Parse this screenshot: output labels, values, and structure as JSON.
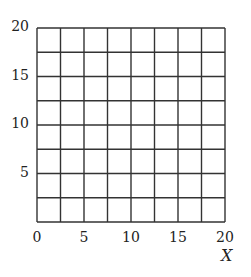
{
  "chart_data": {
    "type": "grid",
    "title": "",
    "xlabel": "X",
    "ylabel": "",
    "xlim": [
      0,
      20
    ],
    "ylim": [
      0,
      20
    ],
    "grid": true,
    "grid_step": 2.5,
    "grid_cells": {
      "columns": 8,
      "rows": 8
    },
    "x_ticks": [
      0,
      5,
      10,
      15,
      20
    ],
    "y_ticks": [
      5,
      10,
      15,
      20
    ],
    "x_tick_labels": [
      "0",
      "5",
      "10",
      "15",
      "20"
    ],
    "y_tick_labels": [
      "5",
      "10",
      "15",
      "20"
    ],
    "series": [],
    "legend": null
  },
  "colors": {
    "grid_line": "#333333",
    "background": "#ffffff",
    "text": "#222222"
  },
  "layout": {
    "left": 37,
    "right": 225,
    "top": 28,
    "bottom": 222
  }
}
